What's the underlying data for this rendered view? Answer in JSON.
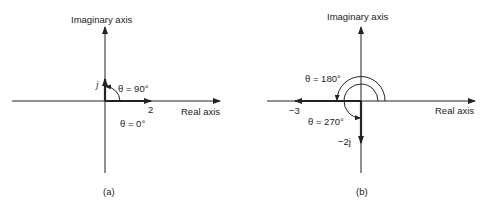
{
  "colors": {
    "ink": "#222222",
    "background": "#ffffff"
  },
  "panels": [
    {
      "id": "a",
      "caption": "(a)",
      "imaginary_axis_label": "Imaginary axis",
      "real_axis_label": "Real axis",
      "vectors": [
        {
          "label": "2",
          "angle_label": "θ = 0°",
          "value": "2",
          "angle_deg": 0
        },
        {
          "label": "j",
          "angle_label": "θ = 90°",
          "value": "j",
          "angle_deg": 90
        }
      ]
    },
    {
      "id": "b",
      "caption": "(b)",
      "imaginary_axis_label": "Imaginary axis",
      "real_axis_label": "Real axis",
      "vectors": [
        {
          "label": "−3",
          "angle_label": "θ = 180°",
          "value": "-3",
          "angle_deg": 180
        },
        {
          "label": "−2j",
          "angle_label": "θ = 270°",
          "value": "-2j",
          "angle_deg": 270
        }
      ]
    }
  ]
}
